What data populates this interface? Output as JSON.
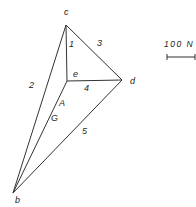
{
  "diagram": {
    "type": "force-polygon",
    "points": {
      "c": {
        "x": 66,
        "y": 25,
        "label": "c"
      },
      "d": {
        "x": 122,
        "y": 80,
        "label": "d"
      },
      "e": {
        "x": 67,
        "y": 81,
        "label": "e"
      },
      "b": {
        "x": 13,
        "y": 193,
        "label": "b"
      }
    },
    "members": {
      "m1": "1",
      "m2": "2",
      "m3": "3",
      "m4": "4",
      "m5": "5"
    },
    "forces": {
      "A": "A",
      "G": "G"
    },
    "scale": {
      "label": "100 N"
    }
  }
}
